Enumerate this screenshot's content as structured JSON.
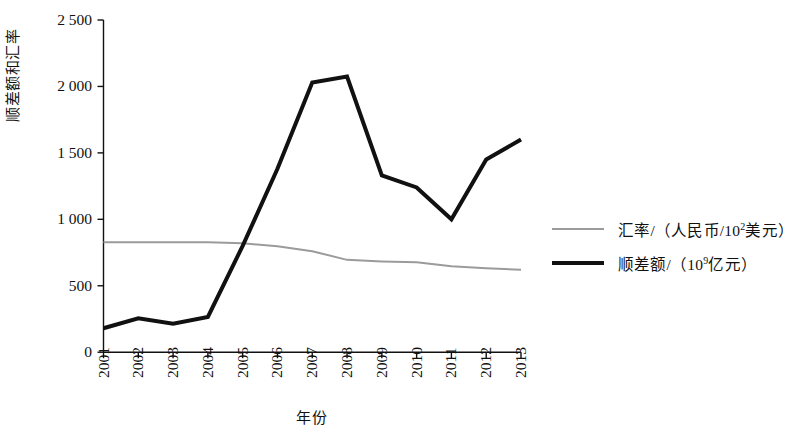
{
  "chart_data": {
    "type": "line",
    "title": "",
    "xlabel": "年份",
    "ylabel": "顺差额和汇率",
    "categories": [
      "2001",
      "2002",
      "2003",
      "2004",
      "2005",
      "2006",
      "2007",
      "2008",
      "2009",
      "2010",
      "2011",
      "2012",
      "2013"
    ],
    "x": [
      2001,
      2002,
      2003,
      2004,
      2005,
      2006,
      2007,
      2008,
      2009,
      2010,
      2011,
      2012,
      2013
    ],
    "ylim": [
      0,
      2500
    ],
    "yticks": [
      0,
      500,
      1000,
      1500,
      2000,
      2500
    ],
    "ytick_labels": [
      "0",
      "500",
      "1 000",
      "1 500",
      "2 000",
      "2 500"
    ],
    "grid": false,
    "legend_position": "right",
    "series": [
      {
        "name": "汇率/（人民币/10²美元）",
        "name_plain": "汇率/（人民币/10^2美元）",
        "color": "#9b9b9b",
        "line_width": 2,
        "values": [
          828,
          827,
          827,
          827,
          819,
          798,
          760,
          695,
          683,
          676,
          646,
          631,
          620
        ]
      },
      {
        "name": "顺差额/（10⁹亿元）",
        "name_plain": "顺差额/（10^9亿元）",
        "color": "#111111",
        "line_width": 4,
        "values": [
          180,
          255,
          215,
          265,
          800,
          1380,
          2030,
          2075,
          1330,
          1240,
          1000,
          1450,
          1600
        ]
      }
    ]
  },
  "legend": {
    "items": [
      {
        "swatch": "rate",
        "prefix": "汇率/（人民币/10",
        "sup": "2",
        "suffix": "美元）"
      },
      {
        "swatch": "surplus",
        "prefix": "顺差额/（10",
        "sup": "9",
        "suffix": "亿元）"
      }
    ]
  },
  "axes": {
    "y_title": "顺差额和汇率",
    "x_title": "年份"
  }
}
